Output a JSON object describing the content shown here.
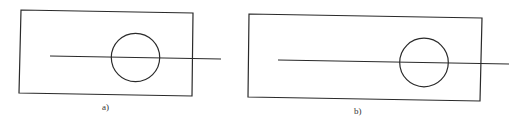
{
  "figure": {
    "panels": [
      {
        "id": "a",
        "label": "a)",
        "description": "Rectangle with a horizontal line passing through a circle; circle near the center-right of the rectangle, line extends beyond the right edge"
      },
      {
        "id": "b",
        "label": "b)",
        "description": "Wider rectangle with a horizontal line passing through a circle positioned toward the right side; line extends beyond the right edge"
      }
    ],
    "colors": {
      "stroke": "#2a2a2a",
      "background": "#ffffff"
    }
  }
}
